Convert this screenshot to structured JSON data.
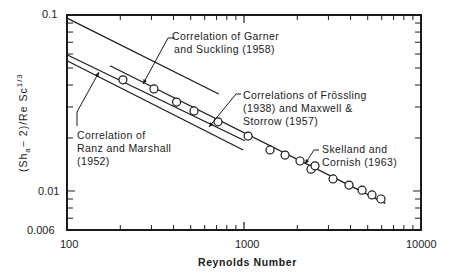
{
  "chart_data": {
    "type": "scatter",
    "title": "",
    "xlabel": "Reynolds Number",
    "ylabel": "(Sh_a - 2)/Re Sc^1/3",
    "xscale": "log",
    "yscale": "log",
    "xlim": [
      100,
      10000
    ],
    "ylim": [
      0.006,
      0.1
    ],
    "x_tick_labels": [
      "100",
      "1000",
      "10000"
    ],
    "y_tick_labels": [
      "0.1",
      "0.01",
      "0.006"
    ],
    "grid": false,
    "series": [
      {
        "name": "Experimental data",
        "marker": "open-circle",
        "x": [
          207,
          310,
          416,
          522,
          713,
          1055,
          1403,
          1706,
          2072,
          2391,
          2519,
          3185,
          3920,
          4645,
          5286,
          5940
        ],
        "y": [
          0.0428,
          0.038,
          0.032,
          0.0285,
          0.0247,
          0.0205,
          0.0171,
          0.016,
          0.0148,
          0.0133,
          0.0139,
          0.0117,
          0.0108,
          0.0101,
          0.0095,
          0.009
        ]
      },
      {
        "name": "Correlation of Garner and Suckling (1958)",
        "type": "line",
        "x": [
          100,
          720
        ],
        "y": [
          0.096,
          0.0356
        ]
      },
      {
        "name": "Correlations of Frössling (1938) and Maxwell & Storrow (1957)",
        "type": "line",
        "x": [
          100,
          1010
        ],
        "y": [
          0.0595,
          0.0193
        ]
      },
      {
        "name": "Correlation of Ranz and Marshall (1952)",
        "type": "line",
        "x": [
          100,
          990
        ],
        "y": [
          0.055,
          0.0171
        ]
      },
      {
        "name": "Skelland and Cornish (1963)",
        "type": "line",
        "x": [
          175,
          6300
        ],
        "y": [
          0.0515,
          0.0085
        ]
      }
    ],
    "annotations": [
      "Correlation of Garner and Suckling (1958)",
      "Correlations of Frössling (1938) and Maxwell & Storrow (1957)",
      "Correlation of Ranz and Marshall (1952)",
      "Skelland and Cornish (1963)"
    ]
  },
  "axes": {
    "xlabel": "Reynolds Number",
    "ylabel_main": "(Sh",
    "ylabel_sub": "a",
    "ylabel_rest": "− 2)/Re Sc",
    "ylabel_sup": "1/3",
    "xticks": [
      "100",
      "1000",
      "10000"
    ],
    "yticks": [
      "0.1",
      "0.01",
      "0.006"
    ]
  },
  "annotations": {
    "garner_1": "Correlation of Garner",
    "garner_2": "and Suckling (1958)",
    "frossling_1": "Correlations of Frössling",
    "frossling_2": "(1938) and Maxwell &",
    "frossling_3": "Storrow (1957)",
    "ranz_1": "Correlation of",
    "ranz_2": "Ranz and Marshall",
    "ranz_3": "(1952)",
    "skelland_1": "Skelland and",
    "skelland_2": "Cornish (1963)"
  }
}
